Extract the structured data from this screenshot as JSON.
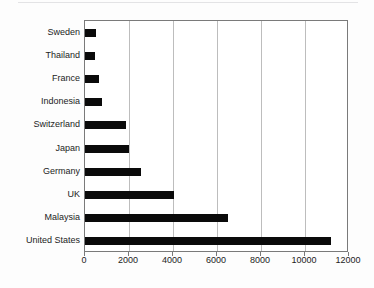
{
  "chart_data": {
    "type": "bar",
    "orientation": "horizontal",
    "title": "",
    "subtitle": "",
    "xlabel": "",
    "ylabel": "",
    "categories": [
      "Sweden",
      "Thailand",
      "France",
      "Indonesia",
      "Switzerland",
      "Japan",
      "Germany",
      "UK",
      "Malaysia",
      "United States"
    ],
    "values": [
      500,
      440,
      620,
      790,
      1870,
      2020,
      2540,
      4050,
      6500,
      11200
    ],
    "xlim": [
      0,
      12000
    ],
    "xticks": [
      0,
      2000,
      4000,
      6000,
      8000,
      10000,
      12000
    ],
    "xtick_labels": [
      "0",
      "2000",
      "4000",
      "6000",
      "8000",
      "10000",
      "12000"
    ],
    "grid": "vertical",
    "legend": "none",
    "bar_color": "#0a0a0a",
    "grid_color": "#bdbdbd",
    "frame_color": "#7a7a7a",
    "background_color": "#ffffff"
  }
}
